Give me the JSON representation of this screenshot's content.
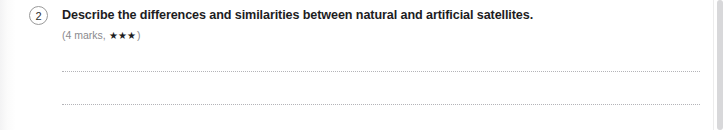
{
  "question": {
    "number": "2",
    "title": "Describe the differences and similarities between natural and artificial satellites.",
    "marks_text": "(4 marks, ",
    "stars": "★★★",
    "marks_close": ")",
    "marks": 4,
    "difficulty_stars": 3
  },
  "answer_lines": [
    {
      "id": "answer-line-1"
    },
    {
      "id": "answer-line-2"
    }
  ],
  "colors": {
    "text_primary": "#1d1d1f",
    "text_muted": "#8a8a8e",
    "circle_border": "#9a9a9a",
    "dotted_rule": "#b4b4b8",
    "scrollbar_thumb": "#d8d8da",
    "background": "#ffffff"
  }
}
